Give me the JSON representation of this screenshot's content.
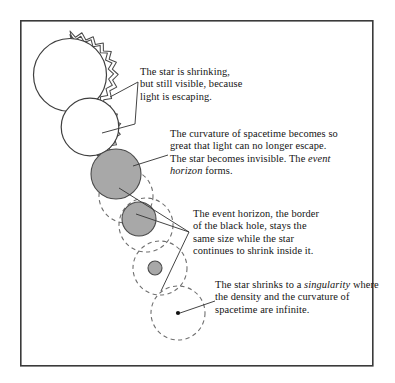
{
  "figure": {
    "background_color": "#ffffff",
    "frame": {
      "x": 20,
      "y": 20,
      "width": 353,
      "height": 346,
      "stroke_color": "#3a3a3a"
    },
    "colors": {
      "star_fill": "#ffffff",
      "collapsed_star_fill": "#a8a8a8",
      "outline": "#3f3f3f",
      "horizon_dash": "#6f6f6f",
      "singularity": "#111111",
      "text": "#141414"
    }
  },
  "stages": [
    {
      "id": "stage-1",
      "name": "visible-star-large",
      "kind": "radiating-star",
      "cx": 70,
      "cy": 75,
      "r": 38,
      "filled": false,
      "rays": 15
    },
    {
      "id": "stage-2",
      "name": "visible-star-smaller",
      "kind": "radiating-star",
      "cx": 90,
      "cy": 134,
      "r": 30,
      "filled": false,
      "rays": 14
    },
    {
      "id": "stage-3",
      "name": "collapsed-star-event-horizon-forms",
      "kind": "dark-star",
      "cx": 116,
      "cy": 174,
      "r": 25,
      "filled": true,
      "horizon_cx": 126,
      "horizon_cy": 196,
      "horizon_r": 27
    },
    {
      "id": "stage-4",
      "name": "shrinking-star-inside-horizon",
      "kind": "dark-star",
      "cx": 139,
      "cy": 219,
      "r": 17,
      "filled": true,
      "horizon_cx": 146,
      "horizon_cy": 225,
      "horizon_r": 27
    },
    {
      "id": "stage-5",
      "name": "shrinking-star-small",
      "kind": "dark-star",
      "cx": 155,
      "cy": 268,
      "r": 7,
      "filled": true,
      "horizon_cx": 160,
      "horizon_cy": 268,
      "horizon_r": 27
    },
    {
      "id": "stage-6",
      "name": "singularity",
      "kind": "singularity",
      "cx": 178,
      "cy": 313,
      "r": 1.9,
      "filled": true,
      "horizon_cx": 178,
      "horizon_cy": 313,
      "horizon_r": 27
    }
  ],
  "captions": [
    {
      "id": "caption-1",
      "name": "caption-star-shrinking",
      "lines": [
        "The star is shrinking,",
        "but still visible, because",
        "light is escaping."
      ],
      "text": "The star is shrinking,\nbut still visible, because\nlight is escaping."
    },
    {
      "id": "caption-2",
      "name": "caption-event-horizon-forms",
      "text_before": "The curvature of spacetime becomes so great that light can no longer escape. The star becomes invisible. The ",
      "italic_term": "event horizon",
      "text_after": " forms.",
      "lines": [
        "The curvature of spacetime",
        "becomes so great that light",
        "can no longer escape. The",
        "star becomes invisible. The",
        "event horizon forms."
      ]
    },
    {
      "id": "caption-3",
      "name": "caption-horizon-stays-same-size",
      "lines": [
        "The event horizon, the border",
        "of the black hole, stays the",
        "same size while the star",
        "continues to shrink inside it."
      ],
      "text": "The event horizon, the border\nof the black hole, stays the\nsame size while the star\ncontinues to shrink inside it."
    },
    {
      "id": "caption-4",
      "name": "caption-singularity",
      "text_before": "The star shrinks to a ",
      "italic_term": "singularity",
      "text_after": " where the density and the curvature of spacetime are infinite.",
      "lines": [
        "The star shrinks to a",
        "singularity where the",
        "density and the curvature of",
        "spacetime are infinite."
      ]
    }
  ],
  "leaders": [
    {
      "name": "leader-caption-1",
      "description": "wedge from the two radiating stars to caption 1",
      "points": "108,98 137,83 134,122 100,131"
    },
    {
      "name": "leader-caption-2",
      "description": "line from the first dark star to caption 2",
      "points": "133,165 168,154"
    },
    {
      "name": "leader-caption-3",
      "description": "three-pronged leader converging toward caption 3",
      "points": "120,189 188,232 136,215 188,232 160,290 188,232"
    },
    {
      "name": "leader-caption-4",
      "description": "line from the singularity dot to caption 4",
      "points": "180,313 214,301"
    }
  ]
}
